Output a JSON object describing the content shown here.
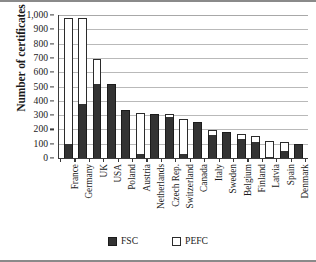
{
  "chart_data": {
    "type": "bar",
    "title": "",
    "xlabel": "",
    "ylabel": "Number of certificates",
    "ylim": [
      0,
      1000
    ],
    "yticks": [
      0,
      100,
      200,
      300,
      400,
      500,
      600,
      700,
      800,
      900,
      1000
    ],
    "ytick_labels": [
      "0",
      "100",
      "200",
      "300",
      "400",
      "500",
      "600",
      "700",
      "800",
      "900",
      "1,000"
    ],
    "grid": true,
    "stacked": true,
    "legend_position": "bottom",
    "categories": [
      "France",
      "Germany",
      "UK",
      "USA",
      "Poland",
      "Austria",
      "Netherlands",
      "Czech Rep.",
      "Switzerland",
      "Canada",
      "Italy",
      "Sweden",
      "Belgium",
      "Finland",
      "Latvia",
      "Spain",
      "Denmark"
    ],
    "series": [
      {
        "name": "FSC",
        "color": "#333333",
        "values": [
          100,
          375,
          515,
          520,
          335,
          25,
          305,
          285,
          30,
          255,
          160,
          185,
          130,
          115,
          5,
          50,
          95
        ]
      },
      {
        "name": "PEFC",
        "color": "#ffffff",
        "values": [
          880,
          605,
          175,
          0,
          0,
          290,
          0,
          20,
          240,
          0,
          35,
          0,
          35,
          40,
          115,
          60,
          0
        ]
      }
    ],
    "totals": [
      980,
      980,
      690,
      520,
      335,
      315,
      305,
      305,
      270,
      255,
      195,
      185,
      165,
      155,
      120,
      110,
      95
    ]
  },
  "legend": {
    "items": [
      {
        "label": "FSC",
        "swatch": "filled-dark-square"
      },
      {
        "label": "PEFC",
        "swatch": "open-white-square"
      }
    ]
  }
}
